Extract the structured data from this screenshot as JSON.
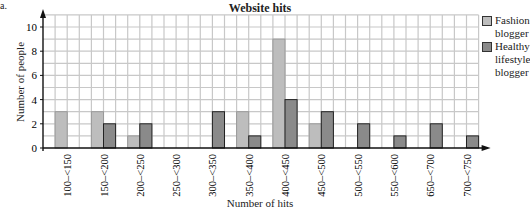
{
  "part_label": "a.",
  "chart_data": {
    "type": "bar",
    "title": "Website hits",
    "xlabel": "Number of hits",
    "ylabel": "Number of people",
    "ylim": [
      0,
      10
    ],
    "yticks": [
      0,
      2,
      4,
      6,
      8,
      10
    ],
    "grid": true,
    "legend_position": "right",
    "categories": [
      "100–<150",
      "150–<200",
      "200–<250",
      "250–<300",
      "300–<350",
      "350–<400",
      "400–<450",
      "450–<500",
      "500–<550",
      "550–<600",
      "650–<700",
      "700–<750"
    ],
    "series": [
      {
        "name": "Fashion blogger",
        "color": "#bdbdbd",
        "values": [
          3,
          3,
          1,
          0,
          0,
          3,
          9,
          2,
          0,
          0,
          0,
          0
        ]
      },
      {
        "name": "Healthy lifestyle blogger",
        "color": "#8a8a8a",
        "values": [
          0,
          2,
          2,
          0,
          3,
          1,
          4,
          3,
          2,
          1,
          2,
          1
        ]
      }
    ]
  },
  "legend": {
    "items": [
      {
        "label_line1": "Fashion",
        "label_line2": "blogger",
        "label_line3": ""
      },
      {
        "label_line1": "Healthy",
        "label_line2": "lifestyle",
        "label_line3": "blogger"
      }
    ]
  }
}
